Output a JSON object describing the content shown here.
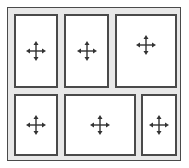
{
  "diagram": {
    "colors": {
      "border": "#4a4a4a",
      "frame_fill": "#e8e8e8",
      "panel_fill": "#ffffff",
      "icon": "#333333"
    },
    "rows": [
      {
        "name": "top-row",
        "panels": [
          {
            "id": "panel-1",
            "icon": "move-icon",
            "x": 14,
            "y": 14,
            "w": 44,
            "h": 74
          },
          {
            "id": "panel-2",
            "icon": "move-icon",
            "x": 64,
            "y": 14,
            "w": 45,
            "h": 74
          },
          {
            "id": "panel-3",
            "icon": "move-icon",
            "x": 115,
            "y": 14,
            "w": 62,
            "h": 74
          }
        ]
      },
      {
        "name": "bottom-row",
        "panels": [
          {
            "id": "panel-4",
            "icon": "move-icon",
            "x": 14,
            "y": 94,
            "w": 44,
            "h": 62
          },
          {
            "id": "panel-5",
            "icon": "move-icon",
            "x": 64,
            "y": 94,
            "w": 72,
            "h": 62
          },
          {
            "id": "panel-6",
            "icon": "move-icon",
            "x": 141,
            "y": 94,
            "w": 36,
            "h": 62
          }
        ]
      }
    ]
  }
}
